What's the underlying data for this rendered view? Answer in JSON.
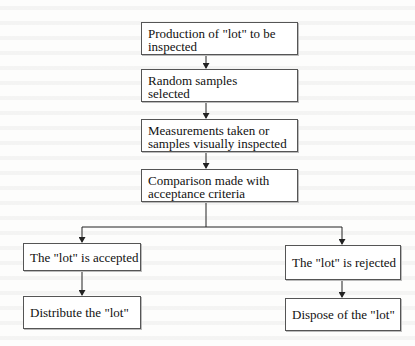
{
  "diagram": {
    "title": "",
    "type": "flowchart",
    "nodes": [
      {
        "id": "production",
        "label": "Production of \"lot\" to be inspected",
        "lines": [
          "Production of \"lot\" to be",
          "inspected"
        ]
      },
      {
        "id": "sampling",
        "label": "Random samples selected",
        "lines": [
          "Random samples",
          "selected"
        ]
      },
      {
        "id": "measurement",
        "label": "Measurements taken or samples visually inspected",
        "lines": [
          "Measurements taken or",
          "samples visually inspected"
        ]
      },
      {
        "id": "comparison",
        "label": "Comparison made with acceptance criteria",
        "lines": [
          "Comparison made with",
          "acceptance criteria"
        ]
      },
      {
        "id": "accepted",
        "label": "The \"lot\" is accepted"
      },
      {
        "id": "distribute",
        "label": "Distribute the \"lot\""
      },
      {
        "id": "rejected",
        "label": "The \"lot\" is rejected"
      },
      {
        "id": "dispose",
        "label": "Dispose of the \"lot\""
      }
    ],
    "edges": [
      {
        "from": "production",
        "to": "sampling"
      },
      {
        "from": "sampling",
        "to": "measurement"
      },
      {
        "from": "measurement",
        "to": "comparison"
      },
      {
        "from": "comparison",
        "to": "accepted"
      },
      {
        "from": "comparison",
        "to": "rejected"
      },
      {
        "from": "accepted",
        "to": "distribute"
      },
      {
        "from": "rejected",
        "to": "dispose"
      }
    ]
  },
  "colors": {
    "line": "#222222",
    "box_border": "#555555",
    "background": "#fdfdfc"
  }
}
